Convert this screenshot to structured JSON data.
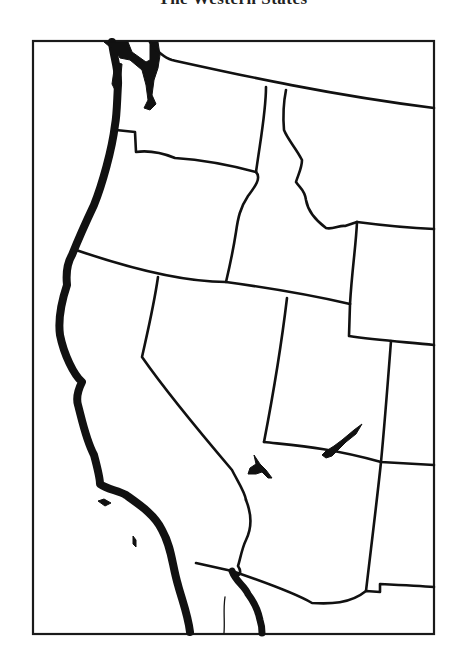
{
  "page": {
    "title": "The Western States"
  },
  "map": {
    "type": "outline-map",
    "region": "Western United States",
    "style": "black outline on white, no labels",
    "colors": {
      "ink": "#111111",
      "paper": "#ffffff"
    },
    "frame": {
      "x": 33,
      "y": 41,
      "width": 401,
      "height": 593
    },
    "states_depicted": [
      "Washington",
      "Oregon",
      "California",
      "Idaho",
      "Nevada",
      "Montana",
      "Wyoming",
      "Utah",
      "Arizona",
      "Colorado",
      "New Mexico"
    ],
    "water_features": [
      "Pacific coastline",
      "Puget Sound",
      "Great Salt Lake area",
      "Lake Mead / Colorado River",
      "Gulf of California",
      "Channel Islands"
    ],
    "paths": {
      "coast_outer": "M112,42 C113,55 119,70 118,85 C117,100 117,115 115,125 C112,150 102,185 94,205 C86,222 78,240 72,255 C66,265 66,275 67,285 C62,300 58,320 60,335 C64,355 74,375 82,382 C78,390 76,398 78,405 C82,420 86,440 94,455 C98,470 100,478 100,484 C108,490 118,490 126,495 C140,505 155,515 162,530 C172,548 172,565 178,585 C182,600 188,615 190,632",
      "coast_inner_ca_baja": "M232,571 C236,582 244,585 248,594 C254,602 258,610 260,620 C262,626 262,630 262,633",
      "puget_sound": "M130,42 L128,50 C136,56 145,62 150,66 L158,68 C156,60 153,54 150,50 L150,42 Z M143,42 C144,52 150,65 152,80 C153,92 155,100 154,106 C151,110 147,108 146,104",
      "wa_north": "M150,42 C155,50 165,58 172,60 C240,75 330,95 434,108",
      "wa_or": "M116,130 L135,132 L136,152 C150,150 165,154 175,158 C205,160 230,165 256,172",
      "wa_id": "M266,87 C266,110 262,130 256,172",
      "or_id": "M256,172 C262,178 254,188 248,196 C240,208 238,218 236,232 C234,245 230,265 226,282",
      "or_ca_nv": "M76,250 C120,265 180,282 226,282 C270,288 320,297 350,304",
      "id_mt": "M286,90 C283,105 283,118 284,130 C288,140 296,148 302,160 C302,168 298,175 296,182 C300,188 305,190 306,200 C308,212 318,222 326,228 C332,230 340,225 345,226 L357,222",
      "mt_wy": "M357,222 C380,225 410,228 434,229",
      "id_wy": "M357,222 C356,245 352,270 350,304",
      "id_nv_ut": "M226,282",
      "ut_wy_south": "M350,304 L349,336 C375,340 405,342 434,345",
      "nv_ut": "M287,298 C282,340 275,385 264,442",
      "ca_nv": "M158,277 C154,305 148,330 142,357 C165,390 198,430 232,470 C238,482 245,492 246,500",
      "ut_co": "M391,341 C388,380 385,420 381,462",
      "ut_az": "M264,442 C300,446 330,448 381,462 C400,463 418,464 434,465",
      "az_nm": "M381,462 C377,500 372,540 366,591",
      "az_south": "M232,571 C270,584 300,596 312,603 C330,604 350,604 366,591 L380,592 L380,584 C400,585 420,586 434,587",
      "colorado_river": "M246,500 C252,515 252,528 246,540 C242,548 240,560 238,566 C242,572 240,580 232,571 L196,563",
      "ca_baja_border": "M160,561 L232,564",
      "baja_west_edge": "M225,597 C223,610 225,620 224,633"
    },
    "water_bodies": {
      "great_salt_lake": "M359,425 C352,430 342,438 334,446 C330,450 326,452 322,456 C326,458 330,456 334,452 C342,444 350,436 360,428 Z",
      "lake_mead": "M254,457 C256,462 254,468 248,472 C252,474 256,472 260,470 C264,474 268,478 270,478 C266,472 262,466 258,462 Z",
      "channel_islands_1": "M96,502 L104,500 L110,504 L104,506 Z",
      "channel_islands_2": "M132,536 C135,538 137,544 135,548 C132,544 131,540 132,536 Z"
    }
  }
}
